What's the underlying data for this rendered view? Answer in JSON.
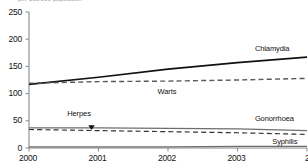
{
  "top_note": "per 100,000 population",
  "chart_data": {
    "type": "line",
    "title": "",
    "subtitle": "per 100,000 population",
    "xlabel": "",
    "ylabel": "",
    "x": [
      2000,
      2001,
      2002,
      2003,
      2004
    ],
    "xtick_labels": [
      "2000",
      "2001",
      "2002",
      "2003",
      "200"
    ],
    "ytick_labels": [
      "0",
      "50",
      "100",
      "150",
      "200",
      "250"
    ],
    "ylim": [
      0,
      250
    ],
    "xlim": [
      2000,
      2004
    ],
    "grid": false,
    "legend": "inline-labels",
    "series": [
      {
        "name": "Chlamydia",
        "style": "solid",
        "color": "#111111",
        "width": 1.6,
        "values": [
          117,
          130,
          145,
          157,
          167
        ]
      },
      {
        "name": "Warts",
        "style": "dashed",
        "color": "#5a5a5a",
        "width": 1.4,
        "values": [
          119,
          122,
          123,
          125,
          128
        ]
      },
      {
        "name": "Gonorrhoea",
        "style": "solid",
        "color": "#6e6e6e",
        "width": 1.2,
        "values": [
          37,
          37,
          36,
          35,
          32
        ]
      },
      {
        "name": "Herpes",
        "style": "dashed",
        "color": "#333333",
        "width": 1.2,
        "values": [
          34,
          32,
          30,
          28,
          25
        ]
      },
      {
        "name": "Syphilis",
        "style": "solid",
        "color": "#6e6e6e",
        "width": 1.2,
        "values": [
          2,
          2,
          2,
          3,
          3
        ]
      }
    ],
    "annotations": [
      {
        "text": "Chlamydia",
        "x": 2003.25,
        "y": 182
      },
      {
        "text": "Warts",
        "x": 2001.85,
        "y": 103
      },
      {
        "text": "Herpes",
        "x": 2000.55,
        "y": 62
      },
      {
        "text": "Gonorrhoea",
        "x": 2003.25,
        "y": 53
      },
      {
        "text": "Syphilis",
        "x": 2003.5,
        "y": 11
      }
    ],
    "markers": [
      {
        "name": "herpes-pointer",
        "shape": "triangle-down",
        "x": 2000.9,
        "y": 34
      }
    ]
  }
}
